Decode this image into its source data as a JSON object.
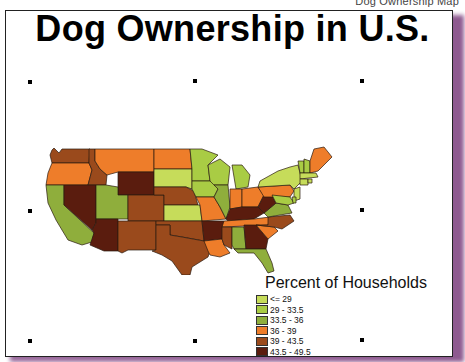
{
  "caption": "Dog Ownership Map",
  "title": "Dog Ownership in U.S.",
  "legend": {
    "title": "Percent of Households",
    "items": [
      {
        "label": "<= 29",
        "color": "#c6dc5a"
      },
      {
        "label": "29 - 33.5",
        "color": "#a9cc44"
      },
      {
        "label": "33.5 - 36",
        "color": "#8fae3c"
      },
      {
        "label": "36 - 39",
        "color": "#ee7d2a"
      },
      {
        "label": "39 - 43.5",
        "color": "#9a4a1c"
      },
      {
        "label": "43.5 - 49.5",
        "color": "#5a1c0e"
      }
    ]
  },
  "colors": {
    "frame_border": "#222222",
    "shadow": "#8e5a90",
    "state_border": "#2a1a10"
  },
  "map_data": {
    "type": "choropleth",
    "region": "Contiguous United States",
    "metric": "Percent of Households owning dogs",
    "states": {
      "WA": "39 - 43.5",
      "OR": "36 - 39",
      "CA": "33.5 - 36",
      "ID": "39 - 43.5",
      "NV": "43.5 - 49.5",
      "MT": "36 - 39",
      "WY": "43.5 - 49.5",
      "UT": "33.5 - 36",
      "AZ": "43.5 - 49.5",
      "CO": "39 - 43.5",
      "NM": "39 - 43.5",
      "ND": "36 - 39",
      "SD": "<= 29",
      "NE": "39 - 43.5",
      "KS": "<= 29",
      "OK": "39 - 43.5",
      "TX": "39 - 43.5",
      "MN": "29 - 33.5",
      "IA": "29 - 33.5",
      "MO": "36 - 39",
      "AR": "43.5 - 49.5",
      "LA": "36 - 39",
      "WI": "29 - 33.5",
      "IL": "33.5 - 36",
      "MI": "29 - 33.5",
      "IN": "36 - 39",
      "OH": "36 - 39",
      "KY": "43.5 - 49.5",
      "TN": "36 - 39",
      "MS": "39 - 43.5",
      "AL": "33.5 - 36",
      "GA": "43.5 - 49.5",
      "FL": "33.5 - 36",
      "SC": "36 - 39",
      "NC": "39 - 43.5",
      "VA": "33.5 - 36",
      "WV": "43.5 - 49.5",
      "PA": "36 - 39",
      "NY": "<= 29",
      "VT": "29 - 33.5",
      "NH": "29 - 33.5",
      "ME": "36 - 39",
      "MA": "<= 29",
      "CT": "<= 29",
      "NJ": "<= 29",
      "DE": "29 - 33.5",
      "MD": "29 - 33.5",
      "RI": "<= 29"
    }
  }
}
